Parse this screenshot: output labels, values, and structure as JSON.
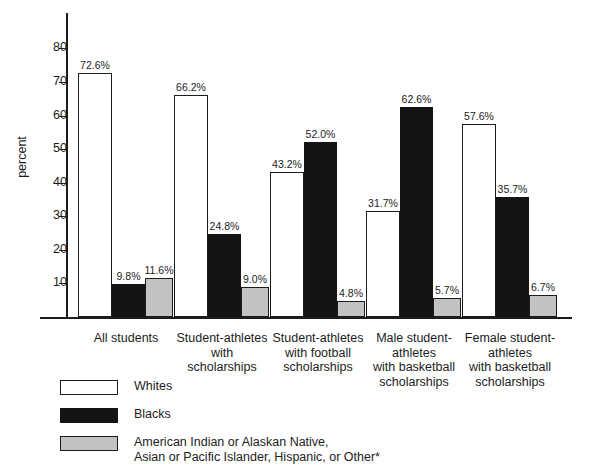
{
  "chart_data": {
    "type": "bar",
    "title": "",
    "subtitle": "",
    "xlabel": "",
    "ylabel": "percent",
    "ylim": [
      0,
      85
    ],
    "yticks": [
      10,
      20,
      30,
      40,
      50,
      60,
      70,
      80
    ],
    "ytick_labels": [
      "10",
      "20",
      "30",
      "40",
      "50",
      "60",
      "70",
      "80"
    ],
    "grid": false,
    "legend_position": "below-plot",
    "categories": [
      "All students",
      "Student-athletes\nwith\nscholarships",
      "Student-athletes\nwith football\nscholarships",
      "Male student-\nathletes\nwith basketball\nscholarships",
      "Female student-\nathletes\nwith basketball\nscholarships"
    ],
    "series": [
      {
        "name": "Whites",
        "color": "#ffffff",
        "values": [
          72.6,
          66.2,
          43.2,
          31.7,
          57.6
        ],
        "labels": [
          "72.6%",
          "66.2%",
          "43.2%",
          "31.7%",
          "57.6%"
        ]
      },
      {
        "name": "Blacks",
        "color": "#141414",
        "values": [
          9.8,
          24.8,
          52.0,
          62.6,
          35.7
        ],
        "labels": [
          "9.8%",
          "24.8%",
          "52.0%",
          "62.6%",
          "35.7%"
        ]
      },
      {
        "name": "American Indian or Alaskan Native,\nAsian or Pacific Islander, Hispanic, or Other*",
        "color": "#c2c2c2",
        "values": [
          11.6,
          9.0,
          4.8,
          5.7,
          6.7
        ],
        "labels": [
          "11.6%",
          "9.0%",
          "4.8%",
          "5.7%",
          "6.7%"
        ]
      }
    ],
    "annotations": []
  },
  "legend": [
    {
      "label": "Whites",
      "swatch": "white"
    },
    {
      "label": "Blacks",
      "swatch": "black"
    },
    {
      "label": "American Indian or Alaskan Native,\nAsian or Pacific Islander, Hispanic, or Other*",
      "swatch": "gray"
    }
  ]
}
